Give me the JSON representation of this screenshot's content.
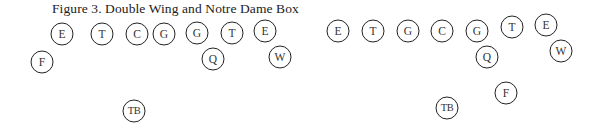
{
  "figure": {
    "title": "Figure 3. Double Wing and Notre Dame Box"
  },
  "diagrams": [
    {
      "name": "double-wing",
      "players": [
        {
          "label": "E",
          "x": 62,
          "y": 34
        },
        {
          "label": "T",
          "x": 102,
          "y": 34
        },
        {
          "label": "C",
          "x": 137,
          "y": 34
        },
        {
          "label": "G",
          "x": 164,
          "y": 34
        },
        {
          "label": "G",
          "x": 197,
          "y": 33
        },
        {
          "label": "T",
          "x": 232,
          "y": 33
        },
        {
          "label": "E",
          "x": 265,
          "y": 31
        },
        {
          "label": "F",
          "x": 42,
          "y": 62
        },
        {
          "label": "Q",
          "x": 213,
          "y": 59
        },
        {
          "label": "W",
          "x": 280,
          "y": 57
        },
        {
          "label": "TB",
          "x": 134,
          "y": 111
        }
      ]
    },
    {
      "name": "notre-dame-box",
      "players": [
        {
          "label": "E",
          "x": 338,
          "y": 31
        },
        {
          "label": "T",
          "x": 373,
          "y": 31
        },
        {
          "label": "G",
          "x": 408,
          "y": 31
        },
        {
          "label": "C",
          "x": 442,
          "y": 31
        },
        {
          "label": "G",
          "x": 477,
          "y": 31
        },
        {
          "label": "T",
          "x": 512,
          "y": 27
        },
        {
          "label": "E",
          "x": 546,
          "y": 25
        },
        {
          "label": "Q",
          "x": 487,
          "y": 57
        },
        {
          "label": "W",
          "x": 561,
          "y": 51
        },
        {
          "label": "F",
          "x": 506,
          "y": 93
        },
        {
          "label": "TB",
          "x": 447,
          "y": 108
        }
      ]
    }
  ],
  "style": {
    "stroke_color": "#222222",
    "text_color": "#333333",
    "background": "#ffffff"
  }
}
